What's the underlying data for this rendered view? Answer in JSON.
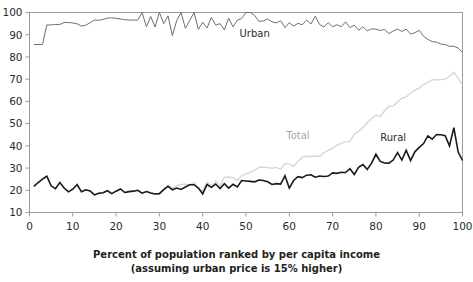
{
  "chart_data": {
    "type": "line",
    "title": "",
    "xlabel": "Percent of population ranked by per capita income",
    "xlabel_sub": "(assuming urban price is 15% higher)",
    "ylabel": "",
    "xlim": [
      0,
      100
    ],
    "ylim": [
      10,
      100
    ],
    "xticks": [
      0,
      10,
      20,
      30,
      40,
      50,
      60,
      70,
      80,
      90,
      100
    ],
    "xtick_labels": [
      "0",
      "10",
      "20",
      "30",
      "40",
      "50",
      "60",
      "70",
      "80",
      "90",
      "100"
    ],
    "yticks": [
      10,
      20,
      30,
      40,
      50,
      60,
      70,
      80,
      90,
      100
    ],
    "ytick_labels": [
      "10",
      "20",
      "30",
      "40",
      "50",
      "60",
      "70",
      "80",
      "90",
      "100"
    ],
    "grid": false,
    "legend_position": "inline-annotations",
    "series": [
      {
        "name": "Urban",
        "color": "#6e6e6e",
        "width": 1,
        "label_x": 52,
        "label_y": 89,
        "label_style": "dark",
        "x": [
          1,
          2,
          3,
          4,
          5,
          6,
          7,
          8,
          9,
          10,
          11,
          12,
          13,
          14,
          15,
          16,
          17,
          18,
          19,
          20,
          21,
          22,
          23,
          24,
          25,
          26,
          27,
          28,
          29,
          30,
          31,
          32,
          33,
          34,
          35,
          36,
          37,
          38,
          39,
          40,
          41,
          42,
          43,
          44,
          45,
          46,
          47,
          48,
          49,
          50,
          51,
          52,
          53,
          54,
          55,
          56,
          57,
          58,
          59,
          60,
          61,
          62,
          63,
          64,
          65,
          66,
          67,
          68,
          69,
          70,
          71,
          72,
          73,
          74,
          75,
          76,
          77,
          78,
          79,
          80,
          81,
          82,
          83,
          84,
          85,
          86,
          87,
          88,
          89,
          90,
          91,
          92,
          93,
          94,
          95,
          96,
          97,
          98,
          99,
          100
        ],
        "values": [
          85.6,
          85.6,
          85.6,
          94.4,
          94.4,
          94.6,
          94.6,
          95.5,
          95.5,
          95.3,
          94.9,
          93.9,
          94.3,
          95.4,
          96.6,
          96.5,
          96.9,
          97.5,
          97.6,
          97.4,
          97.1,
          96.8,
          96.6,
          96.6,
          96.6,
          101.3,
          93.6,
          98.2,
          93.5,
          101.7,
          95.0,
          98.5,
          89.6,
          96.4,
          101.0,
          92.9,
          96.4,
          101.0,
          92.4,
          95.6,
          93.0,
          97.8,
          94.3,
          95.0,
          92.2,
          97.5,
          93.5,
          96.5,
          97.3,
          100.4,
          101.0,
          98.7,
          96.0,
          96.2,
          97.1,
          95.8,
          95.3,
          96.3,
          93.2,
          95.4,
          93.9,
          95.1,
          94.5,
          96.6,
          94.8,
          98.4,
          94.6,
          93.5,
          95.4,
          93.6,
          94.5,
          93.6,
          95.8,
          93.2,
          94.3,
          92.0,
          93.6,
          91.7,
          92.7,
          92.5,
          91.9,
          92.4,
          90.5,
          91.7,
          92.5,
          91.5,
          92.5,
          90.3,
          90.9,
          92.0,
          89.3,
          87.9,
          86.9,
          86.7,
          85.8,
          85.6,
          84.8,
          84.8,
          84.0,
          82.1
        ]
      },
      {
        "name": "Total",
        "color": "#d6d6d6",
        "width": 1.4,
        "label_x": 62,
        "label_y": 43,
        "label_style": "light",
        "x": [
          1,
          2,
          3,
          4,
          5,
          6,
          7,
          8,
          9,
          10,
          11,
          12,
          13,
          14,
          15,
          16,
          17,
          18,
          19,
          20,
          21,
          22,
          23,
          24,
          25,
          26,
          27,
          28,
          29,
          30,
          31,
          32,
          33,
          34,
          35,
          36,
          37,
          38,
          39,
          40,
          41,
          42,
          43,
          44,
          45,
          46,
          47,
          48,
          49,
          50,
          51,
          52,
          53,
          54,
          55,
          56,
          57,
          58,
          59,
          60,
          61,
          62,
          63,
          64,
          65,
          66,
          67,
          68,
          69,
          70,
          71,
          72,
          73,
          74,
          75,
          76,
          77,
          78,
          79,
          80,
          81,
          82,
          83,
          84,
          85,
          86,
          87,
          88,
          89,
          90,
          91,
          92,
          93,
          94,
          95,
          96,
          97,
          98,
          99,
          100
        ],
        "values": [
          21.8,
          23.5,
          25.0,
          26.3,
          22.0,
          20.7,
          23.5,
          21.0,
          19.3,
          20.5,
          22.6,
          19.3,
          20.2,
          19.7,
          17.9,
          18.7,
          18.9,
          19.8,
          18.5,
          19.6,
          20.6,
          19.0,
          19.4,
          19.6,
          20.0,
          18.7,
          19.4,
          18.8,
          18.3,
          18.5,
          20.5,
          22.3,
          21.0,
          22.0,
          22.6,
          22.7,
          22.5,
          23.3,
          21.0,
          19.5,
          23.6,
          22.2,
          24.2,
          22.1,
          25.8,
          26.0,
          25.7,
          24.4,
          26.5,
          27.4,
          28.1,
          29.0,
          30.3,
          30.5,
          30.2,
          29.9,
          30.3,
          29.5,
          32.0,
          31.8,
          30.8,
          33.0,
          34.9,
          35.3,
          35.2,
          35.4,
          35.2,
          37.0,
          38.0,
          39.0,
          40.3,
          41.1,
          41.8,
          42.0,
          45.3,
          46.5,
          48.2,
          50.5,
          52.2,
          53.9,
          53.1,
          55.8,
          57.8,
          58.0,
          59.7,
          61.5,
          62.0,
          63.8,
          65.1,
          66.0,
          67.6,
          68.5,
          69.8,
          69.7,
          69.8,
          70.0,
          71.2,
          73.0,
          70.5,
          67.4
        ]
      },
      {
        "name": "Rural",
        "color": "#1a1a1a",
        "width": 1.6,
        "label_x": 84,
        "label_y": 42,
        "label_style": "dark",
        "x": [
          1,
          2,
          3,
          4,
          5,
          6,
          7,
          8,
          9,
          10,
          11,
          12,
          13,
          14,
          15,
          16,
          17,
          18,
          19,
          20,
          21,
          22,
          23,
          24,
          25,
          26,
          27,
          28,
          29,
          30,
          31,
          32,
          33,
          34,
          35,
          36,
          37,
          38,
          39,
          40,
          41,
          42,
          43,
          44,
          45,
          46,
          47,
          48,
          49,
          50,
          51,
          52,
          53,
          54,
          55,
          56,
          57,
          58,
          59,
          60,
          61,
          62,
          63,
          64,
          65,
          66,
          67,
          68,
          69,
          70,
          71,
          72,
          73,
          74,
          75,
          76,
          77,
          78,
          79,
          80,
          81,
          82,
          83,
          84,
          85,
          86,
          87,
          88,
          89,
          90,
          91,
          92,
          93,
          94,
          95,
          96,
          97,
          98,
          99,
          100
        ],
        "values": [
          21.8,
          23.5,
          25.0,
          26.3,
          22.0,
          20.7,
          23.5,
          21.0,
          19.3,
          20.5,
          22.6,
          19.3,
          20.2,
          19.7,
          17.9,
          18.7,
          18.9,
          19.8,
          18.5,
          19.6,
          20.6,
          19.0,
          19.4,
          19.6,
          20.0,
          18.7,
          19.4,
          18.8,
          18.3,
          18.5,
          20.3,
          21.8,
          20.2,
          21.0,
          20.4,
          21.5,
          22.5,
          22.5,
          21.0,
          18.4,
          22.6,
          21.3,
          22.8,
          20.8,
          23.0,
          21.0,
          22.7,
          21.5,
          24.4,
          24.2,
          24.0,
          23.8,
          24.6,
          24.4,
          23.8,
          22.6,
          23.0,
          22.8,
          26.5,
          21.0,
          24.4,
          26.1,
          25.7,
          26.8,
          27.0,
          25.9,
          26.4,
          26.2,
          26.4,
          27.8,
          27.6,
          28.1,
          28.0,
          29.7,
          27.1,
          30.3,
          31.6,
          29.4,
          32.2,
          36.2,
          33.0,
          32.3,
          32.2,
          33.6,
          37.0,
          33.6,
          38.0,
          33.4,
          37.3,
          39.3,
          41.0,
          44.5,
          43.0,
          45.1,
          45.0,
          44.6,
          40.0,
          48.2,
          37.2,
          33.4
        ]
      }
    ]
  },
  "axis": {
    "frame_color": "#9a9a9a"
  }
}
